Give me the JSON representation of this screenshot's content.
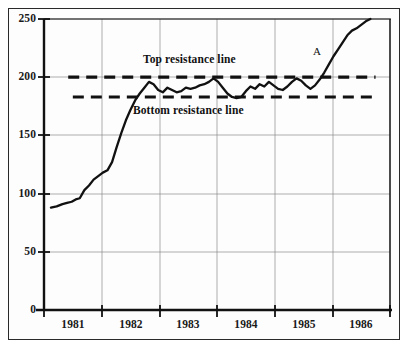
{
  "chart_data": {
    "type": "line",
    "title": "",
    "subtitle": "",
    "xlabel": "",
    "ylabel": "",
    "xlim": [
      1980.6,
      1986.6
    ],
    "ylim": [
      0,
      250
    ],
    "grid": true,
    "legend": "none",
    "y_ticks": [
      0,
      50,
      100,
      150,
      200,
      250
    ],
    "y_tick_labels": [
      "0",
      "50",
      "100",
      "150",
      "200",
      "250"
    ],
    "x_ticks": [
      1981,
      1982,
      1983,
      1984,
      1985,
      1986
    ],
    "x_tick_labels": [
      "1981",
      "1982",
      "1983",
      "1984",
      "1985",
      "1986"
    ],
    "series": [
      {
        "name": "price",
        "x": [
          1980.72,
          1980.82,
          1980.92,
          1981.0,
          1981.08,
          1981.15,
          1981.22,
          1981.3,
          1981.38,
          1981.46,
          1981.54,
          1981.62,
          1981.7,
          1981.78,
          1981.86,
          1981.94,
          1982.02,
          1982.1,
          1982.18,
          1982.26,
          1982.34,
          1982.42,
          1982.5,
          1982.58,
          1982.66,
          1982.74,
          1982.82,
          1982.9,
          1982.98,
          1983.06,
          1983.14,
          1983.22,
          1983.3,
          1983.38,
          1983.46,
          1983.54,
          1983.62,
          1983.7,
          1983.78,
          1983.86,
          1983.94,
          1984.02,
          1984.1,
          1984.18,
          1984.26,
          1984.34,
          1984.42,
          1984.5,
          1984.58,
          1984.66,
          1984.74,
          1984.82,
          1984.9,
          1984.98,
          1985.06,
          1985.14,
          1985.22,
          1985.3,
          1985.38,
          1985.46,
          1985.54,
          1985.62,
          1985.7,
          1985.78,
          1985.86,
          1985.94,
          1986.02,
          1986.1,
          1986.18,
          1986.26
        ],
        "y": [
          88,
          89,
          91,
          92,
          93,
          95,
          96,
          103,
          107,
          112,
          115,
          118,
          120,
          127,
          140,
          152,
          163,
          172,
          180,
          186,
          191,
          196,
          194,
          189,
          187,
          191,
          189,
          187,
          188,
          191,
          190,
          191,
          193,
          194,
          196,
          199,
          196,
          191,
          186,
          183,
          182,
          183,
          188,
          192,
          190,
          194,
          192,
          196,
          193,
          190,
          189,
          192,
          196,
          199,
          197,
          193,
          190,
          193,
          198,
          204,
          211,
          218,
          224,
          230,
          236,
          240,
          242,
          245,
          248,
          250
        ]
      }
    ],
    "reference_lines": [
      {
        "name": "top-resistance-line",
        "label": "Top resistance line",
        "value": 200,
        "x_start": 1981.02,
        "x_end": 1986.35,
        "style": "dashed"
      },
      {
        "name": "bottom-resistance-line",
        "label": "Bottom resistance line",
        "value": 183,
        "x_start": 1981.1,
        "x_end": 1986.35,
        "style": "dashed"
      }
    ],
    "annotations": [
      {
        "name": "breakout-point-label",
        "text": "A",
        "x": 1985.48,
        "y": 221
      },
      {
        "name": "top-resistance-label",
        "text": "Top resistance line",
        "x": 1982.3,
        "y": 214
      },
      {
        "name": "bottom-resistance-label",
        "text": "Bottom resistance line",
        "x": 1982.3,
        "y": 170
      }
    ],
    "colors": {
      "line": "#111111",
      "grid": "#8a8a8a",
      "axis": "#111111",
      "reference_line": "#111111",
      "background": "#fdfdfd",
      "frame": "#2a2a2a"
    }
  }
}
